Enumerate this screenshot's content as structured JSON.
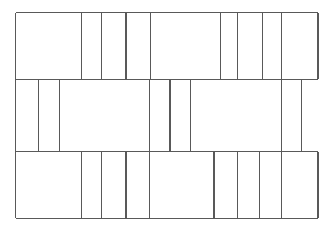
{
  "figure": {
    "type": "line-drawing",
    "background_color": "#ffffff",
    "stroke_color": "#595959",
    "stroke_width": 1.1,
    "canvas": {
      "width": 327,
      "height": 229
    },
    "geometry": {
      "outer_bounds": {
        "left": 15.7,
        "right": 318.0,
        "top": 12.7,
        "bottom": 218.3
      },
      "band_boundaries_y": [
        12.7,
        79.3,
        151.7,
        218.3
      ],
      "bands": [
        {
          "name": "top-band",
          "y_top": 12.7,
          "y_bottom": 79.3,
          "x_left": 15.7,
          "x_right": 318.0,
          "vertical_dividers_x": [
            81.7,
            101.7,
            126.0,
            150.7,
            220.7,
            237.7,
            262.7,
            281.7
          ],
          "cell_count": 9
        },
        {
          "name": "middle-band",
          "y_top": 79.3,
          "y_bottom": 151.7,
          "x_left": 15.7,
          "x_right": 301.7,
          "vertical_dividers_x": [
            38.3,
            59.3,
            149.3,
            170.0,
            190.7,
            281.7
          ],
          "cell_count": 7
        },
        {
          "name": "bottom-band",
          "y_top": 151.7,
          "y_bottom": 218.3,
          "x_left": 15.7,
          "x_right": 318.0,
          "vertical_dividers_x": [
            81.7,
            101.7,
            126.0,
            149.3,
            214.0,
            237.3,
            259.3,
            281.7
          ],
          "cell_count": 9
        }
      ],
      "full_height_verticals_x": [
        15.7,
        81.7,
        150.7,
        281.7
      ],
      "horizontal_segments": [
        {
          "name": "top-edge",
          "y": 12.7,
          "x1": 15.7,
          "x2": 318.0
        },
        {
          "name": "band1-band2-divider",
          "y": 79.3,
          "x1": 15.7,
          "x2": 318.0
        },
        {
          "name": "band2-band3-divider",
          "y": 151.7,
          "x1": 15.7,
          "x2": 318.0
        },
        {
          "name": "bottom-edge",
          "y": 218.3,
          "x1": 15.7,
          "x2": 318.0
        }
      ]
    }
  }
}
